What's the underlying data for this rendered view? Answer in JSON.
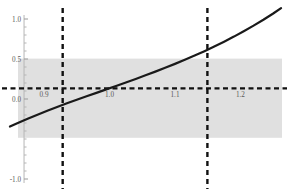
{
  "chart_data": {
    "type": "line",
    "title": "",
    "subtitle": "",
    "xlabel": "",
    "ylabel": "",
    "xlim": [
      0.845,
      1.268
    ],
    "ylim": [
      -1.05,
      1.05
    ],
    "grid": false,
    "legend": null,
    "x_ticks": [
      {
        "value": 0.9,
        "label": "0.9"
      },
      {
        "value": 1.0,
        "label": "1.0"
      },
      {
        "value": 1.1,
        "label": "1.1"
      },
      {
        "value": 1.2,
        "label": "1.2"
      }
    ],
    "y_ticks": [
      {
        "value": 1.0,
        "label": "1.0"
      },
      {
        "value": 0.5,
        "label": "0.5"
      },
      {
        "value": 0.0,
        "label": "0.0"
      },
      {
        "value": -1.0,
        "label": "-1.0"
      }
    ],
    "y_minor_ticks": [
      0.9,
      0.8,
      0.7,
      0.6,
      0.4,
      0.3,
      0.2,
      0.1,
      -0.1,
      -0.2,
      -0.3,
      -0.4,
      -0.5,
      -0.6,
      -0.7,
      -0.8,
      -0.9
    ],
    "series": [
      {
        "name": "curve",
        "type": "line",
        "color": "#1a1a1a",
        "width": 2.2,
        "points": [
          [
            0.848,
            -0.345
          ],
          [
            0.86,
            -0.3
          ],
          [
            0.875,
            -0.247
          ],
          [
            0.89,
            -0.196
          ],
          [
            0.905,
            -0.147
          ],
          [
            0.92,
            -0.1
          ],
          [
            0.935,
            -0.054
          ],
          [
            0.95,
            -0.01
          ],
          [
            0.965,
            0.034
          ],
          [
            0.98,
            0.077
          ],
          [
            0.995,
            0.12
          ],
          [
            1.01,
            0.163
          ],
          [
            1.025,
            0.207
          ],
          [
            1.04,
            0.251
          ],
          [
            1.055,
            0.296
          ],
          [
            1.07,
            0.342
          ],
          [
            1.085,
            0.39
          ],
          [
            1.1,
            0.439
          ],
          [
            1.115,
            0.49
          ],
          [
            1.13,
            0.543
          ],
          [
            1.145,
            0.598
          ],
          [
            1.16,
            0.656
          ],
          [
            1.175,
            0.717
          ],
          [
            1.19,
            0.78
          ],
          [
            1.205,
            0.847
          ],
          [
            1.22,
            0.917
          ],
          [
            1.235,
            0.991
          ],
          [
            1.25,
            1.069
          ],
          [
            1.262,
            1.135
          ]
        ]
      }
    ],
    "reference_lines": [
      {
        "name": "horizontal-reference",
        "orientation": "horizontal",
        "value": 0.132,
        "style": "dashed",
        "color": "#111111",
        "width": 2.2
      },
      {
        "name": "vertical-reference-left",
        "orientation": "vertical",
        "value": 0.9285,
        "style": "dashed",
        "color": "#111111",
        "width": 2.4
      },
      {
        "name": "vertical-reference-right",
        "orientation": "vertical",
        "value": 1.1495,
        "style": "dashed",
        "color": "#111111",
        "width": 2.4
      }
    ],
    "shaded_band": {
      "name": "confidence-band",
      "orientation": "horizontal",
      "y_from": 0.505,
      "y_to": -0.485,
      "color": "#e0e0e0",
      "opacity": 1
    },
    "axis_lines": [
      {
        "name": "y-axis",
        "orientation": "vertical",
        "value": 0.8695,
        "color": "#b6b6b6",
        "width": 1
      }
    ]
  }
}
